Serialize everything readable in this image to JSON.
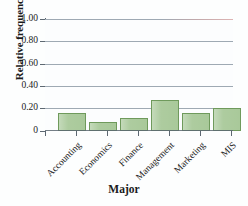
{
  "chart_data": {
    "type": "bar",
    "title": "",
    "xlabel": "Major",
    "ylabel": "Relative frequency",
    "categories": [
      "Accounting",
      "Economics",
      "Finance",
      "Management",
      "Marketing",
      "MIS"
    ],
    "values": [
      0.16,
      0.08,
      0.12,
      0.28,
      0.16,
      0.21
    ],
    "ylim": [
      0,
      1.0
    ],
    "ytick_labels": [
      "1.00",
      "0.80",
      "0.60",
      "0.40",
      "0.20",
      "0"
    ],
    "ytick_values": [
      1.0,
      0.8,
      0.6,
      0.4,
      0.2,
      0
    ],
    "grid": true,
    "legend": "none",
    "bar_fill_color": "#a9c99a",
    "bar_edge_color": "#6f9a5c",
    "axis_color": "#5d6872",
    "gridline_color": "#8d9aa6",
    "background_color": "#fcfdfe"
  }
}
